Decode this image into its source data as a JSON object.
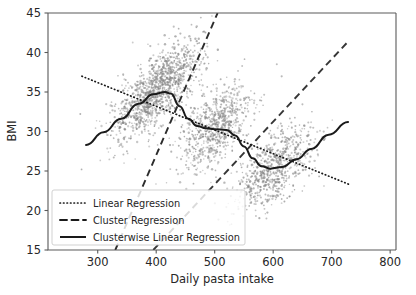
{
  "chart_data": {
    "type": "scatter",
    "title": "",
    "xlabel": "Daily pasta intake",
    "ylabel": "BMI",
    "xlim": [
      215,
      810
    ],
    "ylim": [
      15,
      45
    ],
    "xticks": [
      300,
      400,
      500,
      600,
      700,
      800
    ],
    "yticks": [
      15,
      20,
      25,
      30,
      35,
      40,
      45
    ],
    "grid": false,
    "legend_position": "lower left",
    "point_color": "#808080",
    "line_color": "#1a1a1a",
    "scatter_description": "Dense gray point cloud of four overlapping clusters of individual observations; each cluster trends upward locally while successive clusters are centered at progressively lower BMI, producing an overall downward global trend.",
    "clusters": [
      {
        "name": "cluster-1",
        "x_range": [
          270,
          460
        ],
        "y_range": [
          26,
          41
        ],
        "x_center": 385,
        "y_center": 34.0,
        "n_points": 700,
        "slope": 0.052,
        "intercept": 14.0
      },
      {
        "name": "cluster-2",
        "x_range": [
          400,
          580
        ],
        "y_range": [
          22,
          39
        ],
        "x_center": 500,
        "y_center": 30.5,
        "n_points": 700,
        "slope": 0.05,
        "intercept": 5.5
      },
      {
        "name": "cluster-3",
        "x_range": [
          500,
          690
        ],
        "y_range": [
          18,
          34
        ],
        "x_center": 600,
        "y_center": 25.3,
        "n_points": 700,
        "slope": 0.048,
        "intercept": -3.5
      },
      {
        "name": "cluster-4",
        "x_range": [
          330,
          500
        ],
        "y_range": [
          28,
          45
        ],
        "x_center": 420,
        "y_center": 36.6,
        "n_points": 520,
        "slope": 0.055,
        "intercept": 13.5
      }
    ],
    "series": [
      {
        "name": "Linear Regression",
        "style": "dotted",
        "type": "line",
        "x": [
          273,
          730
        ],
        "y": [
          37.0,
          23.3
        ],
        "slope": -0.03,
        "intercept": 45.2
      },
      {
        "name": "Cluster Regression",
        "style": "dashed",
        "type": "line",
        "segments": [
          {
            "x": [
              330,
              505
            ],
            "y": [
              15.0,
              45.0
            ]
          },
          {
            "x": [
              395,
              727
            ],
            "y": [
              15.0,
              41.3
            ]
          }
        ]
      },
      {
        "name": "Clusterwise Linear Regression",
        "style": "solid",
        "type": "line",
        "x": [
          280,
          310,
          340,
          370,
          395,
          415,
          425,
          440,
          455,
          470,
          485,
          500,
          520,
          535,
          550,
          565,
          580,
          595,
          615,
          640,
          665,
          695,
          728
        ],
        "y": [
          28.3,
          29.9,
          31.6,
          33.5,
          34.7,
          35.0,
          34.8,
          33.2,
          31.6,
          30.7,
          30.4,
          30.3,
          30.2,
          29.5,
          28.1,
          26.6,
          25.6,
          25.3,
          25.5,
          26.5,
          27.8,
          29.6,
          31.2
        ]
      }
    ],
    "legend": [
      {
        "label": "Linear Regression",
        "style": "dotted"
      },
      {
        "label": "Cluster Regression",
        "style": "dashed"
      },
      {
        "label": "Clusterwise Linear Regression",
        "style": "solid"
      }
    ]
  },
  "axes": {
    "ylabel": "BMI",
    "xlabel": "Daily pasta intake",
    "xtick_labels": [
      "300",
      "400",
      "500",
      "600",
      "700",
      "800"
    ],
    "ytick_labels": [
      "15",
      "20",
      "25",
      "30",
      "35",
      "40",
      "45"
    ]
  },
  "legend": {
    "items": [
      {
        "label": "Linear Regression"
      },
      {
        "label": "Cluster Regression"
      },
      {
        "label": "Clusterwise Linear Regression"
      }
    ]
  }
}
